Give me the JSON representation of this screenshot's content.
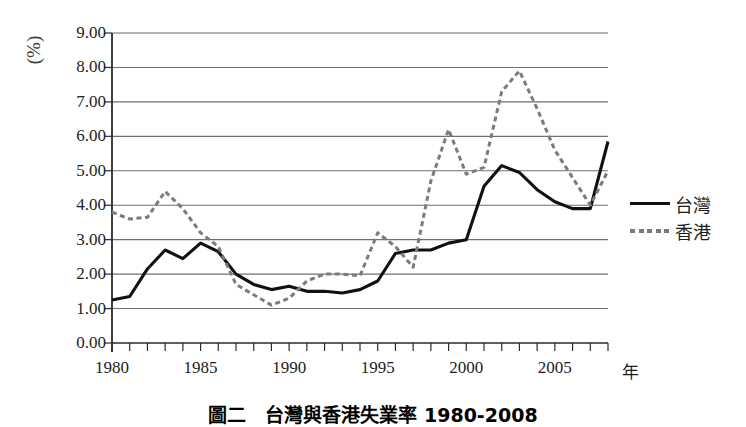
{
  "figure": {
    "caption": "圖二　台灣與香港失業率 1980-2008",
    "y_unit_label": "(%)",
    "x_axis_label": "年"
  },
  "legend": {
    "position": "right",
    "items": [
      {
        "label": "台灣",
        "style": "solid",
        "color": "#111111",
        "swatch_name": "solid-line-swatch"
      },
      {
        "label": "香港",
        "style": "dashed",
        "color": "#7b7b7b",
        "swatch_name": "dashed-line-swatch"
      }
    ]
  },
  "axes": {
    "y_ticks": [
      "0.00",
      "1.00",
      "2.00",
      "3.00",
      "4.00",
      "5.00",
      "6.00",
      "7.00",
      "8.00",
      "9.00"
    ],
    "x_ticks": [
      "1980",
      "1985",
      "1990",
      "1995",
      "2000",
      "2005"
    ]
  },
  "chart_data": {
    "type": "line",
    "title": "圖二　台灣與香港失業率 1980-2008",
    "xlabel": "年",
    "ylabel": "(%)",
    "xlim": [
      1980,
      2008
    ],
    "ylim": [
      0.0,
      9.0
    ],
    "ytick_step": 1.0,
    "grid": "horizontal",
    "legend_position": "right",
    "x": [
      1980,
      1981,
      1982,
      1983,
      1984,
      1985,
      1986,
      1987,
      1988,
      1989,
      1990,
      1991,
      1992,
      1993,
      1994,
      1995,
      1996,
      1997,
      1998,
      1999,
      2000,
      2001,
      2002,
      2003,
      2004,
      2005,
      2006,
      2007,
      2008
    ],
    "series": [
      {
        "name": "台灣",
        "style": "solid",
        "color": "#111111",
        "values": [
          1.25,
          1.35,
          2.15,
          2.7,
          2.45,
          2.9,
          2.65,
          2.0,
          1.7,
          1.55,
          1.65,
          1.5,
          1.5,
          1.45,
          1.55,
          1.8,
          2.6,
          2.7,
          2.7,
          2.9,
          3.0,
          4.55,
          5.15,
          4.95,
          4.45,
          4.1,
          3.9,
          3.9,
          5.85
        ]
      },
      {
        "name": "香港",
        "style": "dashed",
        "color": "#7b7b7b",
        "values": [
          3.8,
          3.6,
          3.65,
          4.4,
          3.9,
          3.2,
          2.8,
          1.7,
          1.4,
          1.1,
          1.3,
          1.8,
          2.0,
          2.0,
          1.95,
          3.2,
          2.8,
          2.2,
          4.7,
          6.2,
          4.9,
          5.1,
          7.3,
          7.9,
          6.8,
          5.6,
          4.8,
          4.0,
          5.0
        ]
      }
    ]
  }
}
